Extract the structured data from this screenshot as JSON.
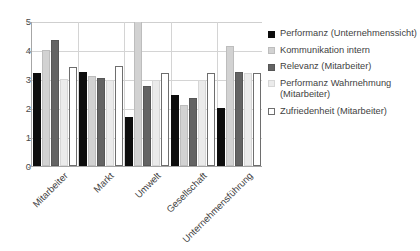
{
  "chart_data": {
    "type": "bar",
    "title": "",
    "xlabel": "",
    "ylabel": "",
    "ylim": [
      0,
      5
    ],
    "yticks": [
      0,
      1,
      2,
      3,
      4,
      5
    ],
    "grid": true,
    "legend_position": "right",
    "categories": [
      "Mitarbeiter",
      "Markt",
      "Umwelt",
      "Gesellschaft",
      "Unternehmensführung"
    ],
    "series": [
      {
        "name": "Performanz (Unternehmenssicht)",
        "color": "#0d0d0d",
        "values": [
          3.2,
          3.25,
          1.7,
          2.45,
          2.0
        ]
      },
      {
        "name": "Kommunikation intern",
        "color": "#d2d2d2",
        "values": [
          4.0,
          3.1,
          5.0,
          2.1,
          4.15
        ]
      },
      {
        "name": "Relevanz (Mitarbeiter)",
        "color": "#636363",
        "values": [
          4.35,
          3.05,
          2.75,
          2.35,
          3.25
        ]
      },
      {
        "name": "Performanz Wahrnehmung (Mitarbeiter)",
        "color": "#ebebeb",
        "values": [
          3.0,
          2.95,
          2.98,
          2.95,
          3.2
        ]
      },
      {
        "name": "Zufriedenheit (Mitarbeiter)",
        "color": "#ffffff",
        "values": [
          3.4,
          3.45,
          3.2,
          3.2,
          3.2
        ]
      }
    ]
  },
  "axis": {
    "y_tick_labels": [
      "5",
      "4",
      "3",
      "2",
      "1",
      "0"
    ]
  },
  "legend": {
    "items": [
      {
        "label": "Performanz (Unternehmenssicht)"
      },
      {
        "label": "Kommunikation intern"
      },
      {
        "label": "Relevanz (Mitarbeiter)"
      },
      {
        "label": "Performanz Wahrnehmung (Mitarbeiter)"
      },
      {
        "label": "Zufriedenheit (Mitarbeiter)"
      }
    ]
  }
}
